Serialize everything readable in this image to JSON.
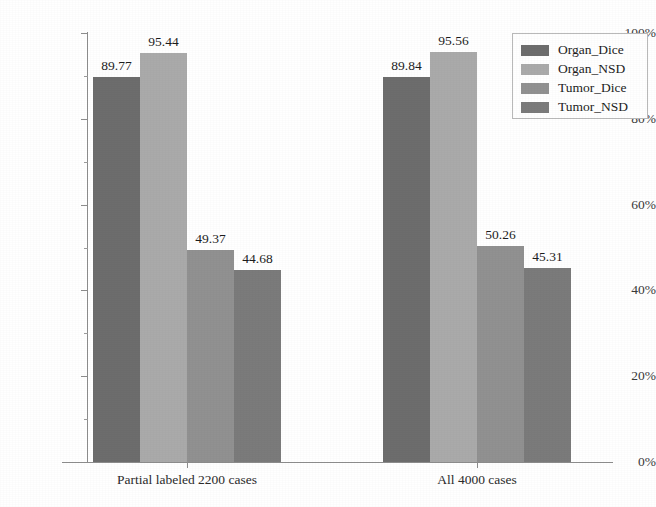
{
  "chart_data": {
    "type": "bar",
    "title": "",
    "subtitle": "",
    "xlabel": "",
    "ylabel": "",
    "categories": [
      "Partial labeled 2200 cases",
      "All 4000 cases"
    ],
    "series": [
      {
        "name": "Organ_Dice",
        "values": [
          89.77,
          95.44
        ],
        "color": "#6d6d6d"
      },
      {
        "name": "Organ_NSD",
        "values": [
          95.44,
          95.56
        ],
        "color": "#aaaaaa"
      },
      {
        "name": "Tumor_Dice",
        "values": [
          49.37,
          50.26
        ],
        "color": "#919191"
      },
      {
        "name": "Tumor_NSD",
        "values": [
          44.68,
          45.31
        ],
        "color": "#7b7b7b"
      }
    ],
    "bar_values": [
      [
        "89.77",
        "95.44",
        "49.37",
        "44.68"
      ],
      [
        "89.84",
        "95.56",
        "50.26",
        "45.31"
      ]
    ],
    "ylim": [
      0,
      100
    ],
    "ytick_labels": [
      "0%",
      "20%",
      "40%",
      "60%",
      "80%",
      "100%"
    ],
    "ytick_values": [
      0,
      20,
      40,
      60,
      80,
      100
    ],
    "yminor_values": [
      10,
      30,
      50,
      70,
      90
    ],
    "grid": false,
    "legend_position": "top-right",
    "legend_entries": [
      "Organ_Dice",
      "Organ_NSD",
      "Tumor_Dice",
      "Tumor_NSD"
    ]
  },
  "axes": {
    "y_ticks": [
      {
        "label": "100%",
        "value": 100
      },
      {
        "label": "80%",
        "value": 80
      },
      {
        "label": "60%",
        "value": 60
      },
      {
        "label": "40%",
        "value": 40
      },
      {
        "label": "20%",
        "value": 20
      },
      {
        "label": "0%",
        "value": 0
      }
    ],
    "x_categories": [
      {
        "label": "Partial labeled 2200 cases"
      },
      {
        "label": "All 4000 cases"
      }
    ]
  },
  "legend": {
    "items": [
      {
        "label": "Organ_Dice",
        "color": "#6d6d6d"
      },
      {
        "label": "Organ_NSD",
        "color": "#aaaaaa"
      },
      {
        "label": "Tumor_Dice",
        "color": "#919191"
      },
      {
        "label": "Tumor_NSD",
        "color": "#7b7b7b"
      }
    ]
  },
  "groups": [
    {
      "category": "Partial labeled 2200 cases",
      "bars": [
        {
          "series": "Organ_Dice",
          "value": 89.77,
          "label": "89.77",
          "color": "#6d6d6d"
        },
        {
          "series": "Organ_NSD",
          "value": 95.44,
          "label": "95.44",
          "color": "#aaaaaa"
        },
        {
          "series": "Tumor_Dice",
          "value": 49.37,
          "label": "49.37",
          "color": "#919191"
        },
        {
          "series": "Tumor_NSD",
          "value": 44.68,
          "label": "44.68",
          "color": "#7b7b7b"
        }
      ]
    },
    {
      "category": "All 4000 cases",
      "bars": [
        {
          "series": "Organ_Dice",
          "value": 89.84,
          "label": "89.84",
          "color": "#6d6d6d"
        },
        {
          "series": "Organ_NSD",
          "value": 95.56,
          "label": "95.56",
          "color": "#aaaaaa"
        },
        {
          "series": "Tumor_Dice",
          "value": 50.26,
          "label": "50.26",
          "color": "#919191"
        },
        {
          "series": "Tumor_NSD",
          "value": 45.31,
          "label": "45.31",
          "color": "#7b7b7b"
        }
      ]
    }
  ]
}
